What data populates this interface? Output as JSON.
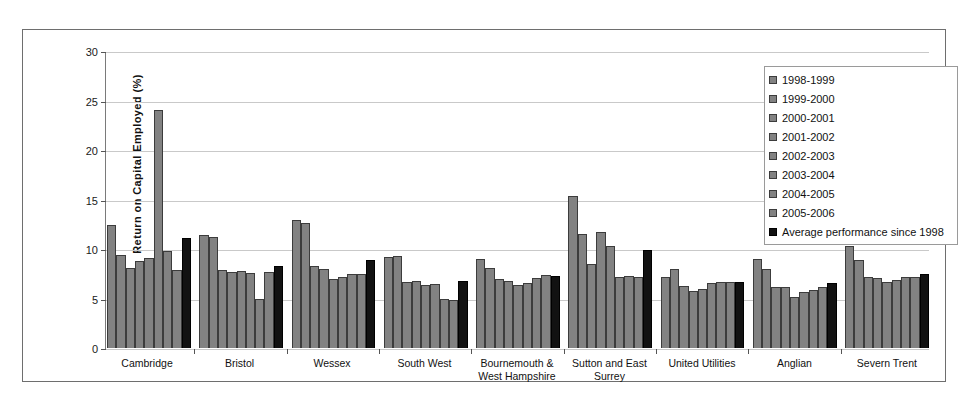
{
  "chart_data": {
    "type": "bar",
    "title": "",
    "xlabel": "",
    "ylabel": "Return on Capital Employed (%)",
    "ylim": [
      0,
      30
    ],
    "yticks": [
      0,
      5,
      10,
      15,
      20,
      25,
      30
    ],
    "grid": true,
    "legend_position": "top-right",
    "categories": [
      "Cambridge",
      "Bristol",
      "Wessex",
      "South West",
      "Bournemouth & West Hampshire",
      "Sutton and East Surrey",
      "United Utilities",
      "Anglian",
      "Severn Trent"
    ],
    "category_lines": [
      [
        "Cambridge"
      ],
      [
        "Bristol"
      ],
      [
        "Wessex"
      ],
      [
        "South West"
      ],
      [
        "Bournemouth &",
        "West Hampshire"
      ],
      [
        "Sutton and East",
        "Surrey"
      ],
      [
        "United Utilities"
      ],
      [
        "Anglian"
      ],
      [
        "Severn Trent"
      ]
    ],
    "series": [
      {
        "name": "1998-1999",
        "color": "#828282",
        "values": [
          12.5,
          11.5,
          13.0,
          9.2,
          9.0,
          15.4,
          7.2,
          9.0,
          10.3
        ]
      },
      {
        "name": "1999-2000",
        "color": "#828282",
        "values": [
          9.4,
          11.3,
          12.7,
          9.3,
          8.1,
          11.6,
          8.0,
          8.0,
          8.9
        ]
      },
      {
        "name": "2000-2001",
        "color": "#828282",
        "values": [
          8.1,
          7.9,
          8.3,
          6.7,
          7.0,
          8.5,
          6.3,
          6.2,
          7.2
        ]
      },
      {
        "name": "2001-2002",
        "color": "#828282",
        "values": [
          8.8,
          7.7,
          8.0,
          6.8,
          6.8,
          11.8,
          5.8,
          6.2,
          7.1
        ]
      },
      {
        "name": "2002-2003",
        "color": "#828282",
        "values": [
          9.1,
          7.8,
          7.0,
          6.4,
          6.4,
          10.3,
          6.0,
          5.2,
          6.7
        ]
      },
      {
        "name": "2003-2004",
        "color": "#828282",
        "values": [
          24.1,
          7.6,
          7.2,
          6.5,
          6.6,
          7.2,
          6.6,
          5.7,
          6.9
        ]
      },
      {
        "name": "2004-2005",
        "color": "#828282",
        "values": [
          9.8,
          5.0,
          7.5,
          5.0,
          7.1,
          7.3,
          6.7,
          5.9,
          7.2
        ]
      },
      {
        "name": "2005-2006",
        "color": "#828282",
        "values": [
          7.9,
          7.7,
          7.5,
          4.9,
          7.4,
          7.2,
          6.7,
          6.2,
          7.2
        ]
      },
      {
        "name": "Average performance since 1998",
        "color": "#121212",
        "values": [
          11.2,
          8.3,
          8.9,
          6.8,
          7.3,
          9.9,
          6.7,
          6.6,
          7.5
        ]
      }
    ]
  },
  "legend": {
    "items": [
      {
        "label": "1998-1999",
        "swatch": "series-swatch"
      },
      {
        "label": "1999-2000",
        "swatch": "series-swatch"
      },
      {
        "label": "2000-2001",
        "swatch": "series-swatch"
      },
      {
        "label": "2001-2002",
        "swatch": "series-swatch"
      },
      {
        "label": "2002-2003",
        "swatch": "series-swatch"
      },
      {
        "label": "2003-2004",
        "swatch": "series-swatch"
      },
      {
        "label": "2004-2005",
        "swatch": "series-swatch"
      },
      {
        "label": "2005-2006",
        "swatch": "series-swatch"
      },
      {
        "label": "Average performance since 1998",
        "swatch": "average-swatch"
      }
    ]
  },
  "colors": {
    "series_bar": "#828282",
    "average_bar": "#121212",
    "bar_outline": "#3c3c3c",
    "gridline": "#c9c9c9",
    "axis": "#555555",
    "frame": "#6e6e6e",
    "background": "#ffffff"
  }
}
